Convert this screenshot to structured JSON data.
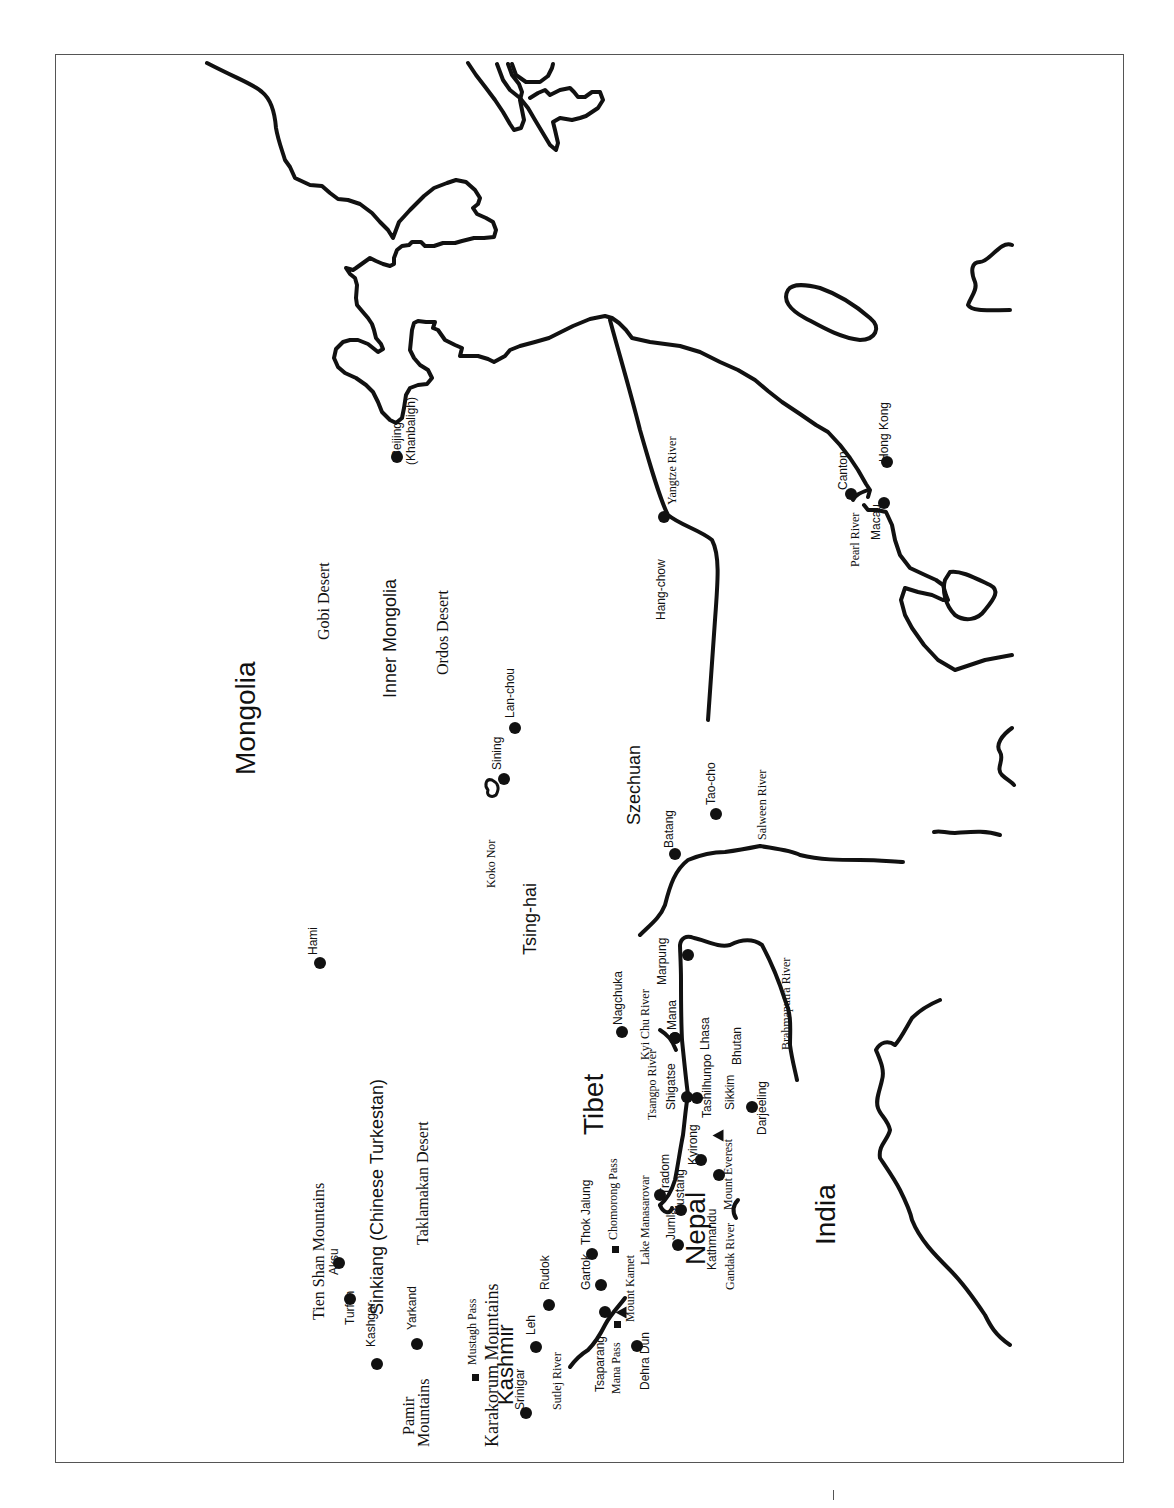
{
  "map": {
    "orientation": "rotated -90deg (north to the left)",
    "regions": [
      {
        "id": "mongolia",
        "label": "Mongolia",
        "x": 235,
        "y": 775,
        "size": 28,
        "font": "sans"
      },
      {
        "id": "gobi",
        "label": "Gobi Desert",
        "x": 318,
        "y": 640,
        "size": 16,
        "font": "serif"
      },
      {
        "id": "inner-mongolia",
        "label": "Inner Mongolia",
        "x": 383,
        "y": 698,
        "size": 18,
        "font": "sans"
      },
      {
        "id": "ordos",
        "label": "Ordos Desert",
        "x": 437,
        "y": 675,
        "size": 16,
        "font": "serif"
      },
      {
        "id": "tsing-hai",
        "label": "Tsing-hai",
        "x": 523,
        "y": 955,
        "size": 18,
        "font": "sans"
      },
      {
        "id": "szechuan",
        "label": "Szechuan",
        "x": 627,
        "y": 825,
        "size": 18,
        "font": "sans"
      },
      {
        "id": "tibet",
        "label": "Tibet",
        "x": 583,
        "y": 1135,
        "size": 28,
        "font": "sans"
      },
      {
        "id": "nepal",
        "label": "Nepal",
        "x": 685,
        "y": 1265,
        "size": 28,
        "font": "sans"
      },
      {
        "id": "india",
        "label": "India",
        "x": 815,
        "y": 1245,
        "size": 28,
        "font": "sans"
      },
      {
        "id": "kashmir",
        "label": "Kashmir",
        "x": 497,
        "y": 1405,
        "size": 22,
        "font": "sans"
      },
      {
        "id": "sinkiang",
        "label": "Sinkiang (Chinese Turkestan)",
        "x": 370,
        "y": 1315,
        "size": 18,
        "font": "sans"
      },
      {
        "id": "taklamakan",
        "label": "Taklamakan Desert",
        "x": 417,
        "y": 1245,
        "size": 16,
        "font": "serif"
      },
      {
        "id": "tien-shan",
        "label": "Tien Shan Mountains",
        "x": 313,
        "y": 1320,
        "size": 16,
        "font": "serif"
      },
      {
        "id": "pamir-1",
        "label": "Pamir",
        "x": 403,
        "y": 1435,
        "size": 16,
        "font": "serif"
      },
      {
        "id": "pamir-2",
        "label": "Mountains",
        "x": 418,
        "y": 1447,
        "size": 16,
        "font": "serif"
      },
      {
        "id": "karakorum",
        "label": "Karakorum Mountains",
        "x": 485,
        "y": 1447,
        "size": 18,
        "font": "serif"
      },
      {
        "id": "koko-nor",
        "label": "Koko Nor",
        "x": 486,
        "y": 888,
        "size": 12,
        "font": "serif"
      }
    ],
    "cities": [
      {
        "label": "Beijing",
        "sub": "(Khanbaligh)",
        "x": 397,
        "y": 458,
        "dot_x": 397,
        "dot_y": 457
      },
      {
        "label": "Hami",
        "x": 313,
        "y": 955,
        "dot_x": 320,
        "dot_y": 963
      },
      {
        "label": "Sining",
        "x": 497,
        "y": 770,
        "dot_x": 504,
        "dot_y": 779
      },
      {
        "label": "Lan-chou",
        "x": 510,
        "y": 718,
        "dot_x": 515,
        "dot_y": 728
      },
      {
        "label": "Batang",
        "x": 669,
        "y": 848,
        "dot_x": 675,
        "dot_y": 854
      },
      {
        "label": "Tao-cho",
        "x": 711,
        "y": 805,
        "dot_x": 716,
        "dot_y": 814
      },
      {
        "label": "Hang-chow",
        "x": 661,
        "y": 620,
        "dot_x": 664,
        "dot_y": 517
      },
      {
        "label": "Canton",
        "x": 843,
        "y": 490,
        "dot_x": 851,
        "dot_y": 494
      },
      {
        "label": "Hong Kong",
        "x": 884,
        "y": 462,
        "dot_x": 887,
        "dot_y": 462
      },
      {
        "label": "Macau",
        "x": 876,
        "y": 540,
        "dot_x": 884,
        "dot_y": 503
      },
      {
        "label": "Aksu",
        "x": 334,
        "y": 1275,
        "dot_x": 339,
        "dot_y": 1263
      },
      {
        "label": "Turfan",
        "x": 350,
        "y": 1325,
        "dot_x": 350,
        "dot_y": 1299
      },
      {
        "label": "Kashgar",
        "x": 371,
        "y": 1347,
        "dot_x": 377,
        "dot_y": 1364
      },
      {
        "label": "Yarkand",
        "x": 412,
        "y": 1330,
        "dot_x": 417,
        "dot_y": 1344
      },
      {
        "label": "Srinigar",
        "x": 520,
        "y": 1410,
        "dot_x": 526,
        "dot_y": 1413
      },
      {
        "label": "Leh",
        "x": 531,
        "y": 1335,
        "dot_x": 536,
        "dot_y": 1347
      },
      {
        "label": "Rudok",
        "x": 545,
        "y": 1290,
        "dot_x": 549,
        "dot_y": 1305
      },
      {
        "label": "Gartok",
        "x": 586,
        "y": 1290,
        "dot_x": 601,
        "dot_y": 1285
      },
      {
        "label": "Thok Jalung",
        "x": 586,
        "y": 1245,
        "dot_x": 592,
        "dot_y": 1254
      },
      {
        "label": "Tsaparang",
        "x": 600,
        "y": 1392,
        "dot_x": 605,
        "dot_y": 1312
      },
      {
        "label": "Dehra Dun",
        "x": 645,
        "y": 1390,
        "dot_x": 637,
        "dot_y": 1346
      },
      {
        "label": "Jumla",
        "x": 671,
        "y": 1240,
        "dot_x": 678,
        "dot_y": 1245
      },
      {
        "label": "Tradom",
        "x": 665,
        "y": 1195,
        "dot_x": 660,
        "dot_y": 1195
      },
      {
        "label": "Mustang",
        "x": 680,
        "y": 1215,
        "dot_x": 681,
        "dot_y": 1210
      },
      {
        "label": "Kyirong",
        "x": 693,
        "y": 1165,
        "dot_x": 701,
        "dot_y": 1160
      },
      {
        "label": "Kathmandu",
        "x": 712,
        "y": 1270,
        "dot_x": 719,
        "dot_y": 1175
      },
      {
        "label": "Shigatse",
        "x": 671,
        "y": 1110,
        "dot_x": 687,
        "dot_y": 1097
      },
      {
        "label": "Tashilhunpo",
        "x": 707,
        "y": 1118,
        "dot_x": 697,
        "dot_y": 1098
      },
      {
        "label": "Lhasa",
        "x": 705,
        "y": 1050,
        "dot_x": 675,
        "dot_y": 1038
      },
      {
        "label": "Mana",
        "x": 672,
        "y": 1030,
        "dot_x": 675,
        "dot_y": 1038
      },
      {
        "label": "Marpung",
        "x": 662,
        "y": 985,
        "dot_x": 688,
        "dot_y": 955
      },
      {
        "label": "Nagchuka",
        "x": 618,
        "y": 1025,
        "dot_x": 622,
        "dot_y": 1032
      },
      {
        "label": "Sikkim",
        "x": 730,
        "y": 1110,
        "dot_x": null,
        "dot_y": null
      },
      {
        "label": "Bhutan",
        "x": 737,
        "y": 1065,
        "dot_x": null,
        "dot_y": null
      },
      {
        "label": "Darjeeling",
        "x": 762,
        "y": 1135,
        "dot_x": 752,
        "dot_y": 1107
      }
    ],
    "passes": [
      {
        "label": "Mustagh Pass",
        "x": 470,
        "y": 1365,
        "mark_x": 475,
        "mark_y": 1377
      },
      {
        "label": "Chomorong Pass",
        "x": 611,
        "y": 1240,
        "mark_x": 615,
        "mark_y": 1249
      },
      {
        "label": "Mana Pass",
        "x": 614,
        "y": 1394,
        "mark_x": 617,
        "mark_y": 1324
      }
    ],
    "peaks": [
      {
        "label": "Mount Kamet",
        "x": 628,
        "y": 1322,
        "mark_x": 621,
        "mark_y": 1313
      },
      {
        "label": "Mount Everest",
        "x": 726,
        "y": 1210,
        "mark_x": 718,
        "mark_y": 1136
      }
    ],
    "rivers": [
      {
        "label": "Yangtze River",
        "x": 670,
        "y": 505
      },
      {
        "label": "Pearl River",
        "x": 853,
        "y": 567
      },
      {
        "label": "Salween River",
        "x": 760,
        "y": 840
      },
      {
        "label": "Brahmaputra River",
        "x": 784,
        "y": 1050
      },
      {
        "label": "Tsangpo River",
        "x": 650,
        "y": 1120
      },
      {
        "label": "Kyi Chu River",
        "x": 643,
        "y": 1060
      },
      {
        "label": "Sutlej River",
        "x": 555,
        "y": 1410
      },
      {
        "label": "Gandak River",
        "x": 728,
        "y": 1290
      },
      {
        "label": "Lake Manasarovar",
        "x": 643,
        "y": 1265
      }
    ]
  }
}
